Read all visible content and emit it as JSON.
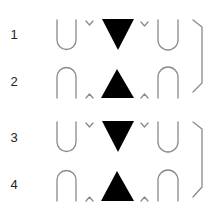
{
  "diagram": {
    "rows": [
      {
        "label": "1",
        "type": "cup",
        "triangle": "down"
      },
      {
        "label": "2",
        "type": "cap",
        "triangle": "up"
      },
      {
        "label": "3",
        "type": "cup",
        "triangle": "down"
      },
      {
        "label": "4",
        "type": "cap",
        "triangle": "up"
      }
    ],
    "colors": {
      "stroke": "#8a8a8a",
      "fill": "#000000",
      "text": "#222222"
    }
  }
}
